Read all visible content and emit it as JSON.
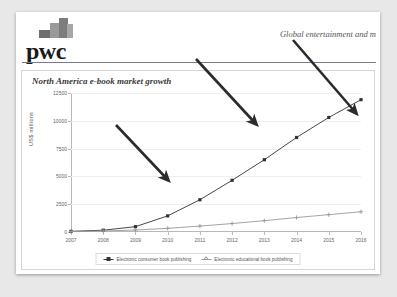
{
  "brand": {
    "logo_text": "pwc",
    "logo_mark_name": "pwc-stepped-blocks-mark"
  },
  "header": {
    "document_title": "Global entertainment and m"
  },
  "chart_data": {
    "type": "line",
    "title": "North America e-book market growth",
    "xlabel": "",
    "ylabel": "US$ millions",
    "grid": true,
    "legend_position": "bottom-center",
    "ylim": [
      0,
      12500
    ],
    "yticks": [
      0,
      2500,
      5000,
      7500,
      10000,
      12500
    ],
    "ytick_labels": [
      "0",
      "2500",
      "5000",
      "7500",
      "10000",
      "12500"
    ],
    "categories": [
      "2007",
      "2008",
      "2009",
      "2010",
      "2011",
      "2012",
      "2013",
      "2014",
      "2015",
      "2016"
    ],
    "series": [
      {
        "name": "Electronic consumer book publishing",
        "color": "#333333",
        "marker": "square",
        "values": [
          60,
          160,
          480,
          1450,
          2900,
          4650,
          6500,
          8500,
          10300,
          11900
        ]
      },
      {
        "name": "Electronic educational book publishing",
        "color": "#9a9a9a",
        "marker": "plus",
        "values": [
          40,
          90,
          180,
          330,
          530,
          760,
          1020,
          1300,
          1560,
          1820
        ]
      }
    ],
    "annotations": [
      {
        "name": "arrow-1",
        "x1": 100,
        "y1": 113,
        "x2": 152,
        "y2": 168
      },
      {
        "name": "arrow-2",
        "x1": 180,
        "y1": 47,
        "x2": 240,
        "y2": 112
      },
      {
        "name": "arrow-3",
        "x1": 277,
        "y1": 28,
        "x2": 340,
        "y2": 101
      }
    ]
  }
}
